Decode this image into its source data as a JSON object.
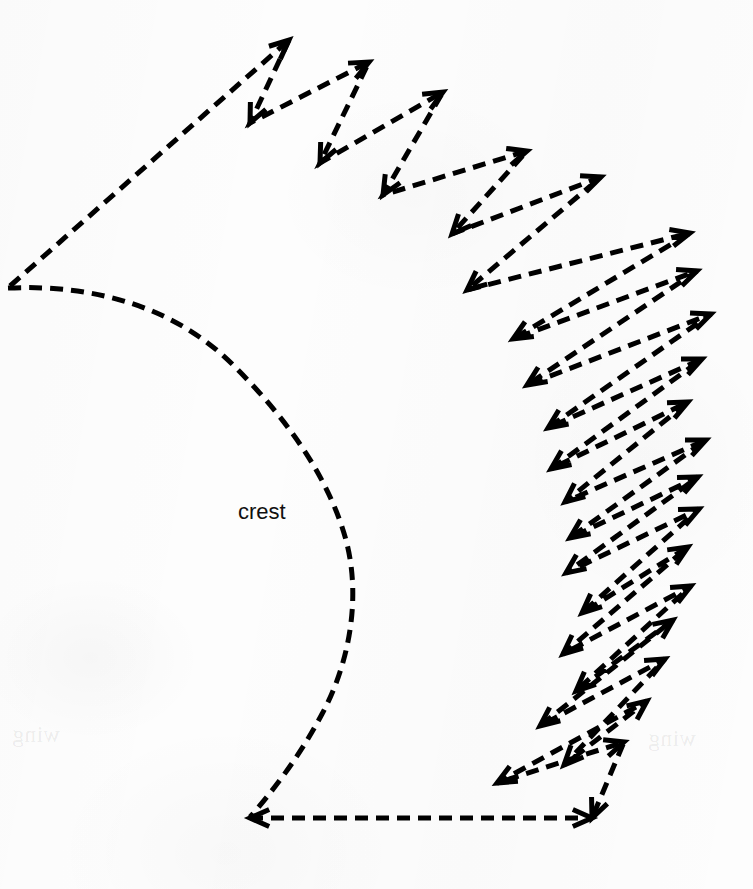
{
  "canvas": {
    "width": 753,
    "height": 889,
    "background_color": "#fdfdfd",
    "ink_color": "#000000"
  },
  "diagram": {
    "title_visible": false,
    "stroke": {
      "color": "#000000",
      "width_px": 5,
      "dash_length_px": 13,
      "gap_length_px": 8,
      "style": "dashed-with-arrowheads"
    },
    "labels": [
      {
        "id": "crest-label",
        "text": "crest",
        "x": 238,
        "y": 501,
        "font_size_px": 22,
        "color": "#101010"
      }
    ],
    "paths": {
      "crest_curve": {
        "name": "crest-curve",
        "description": "smooth dashed curve sweeping from the left edge across and down to the bottom-left corner of the base line",
        "d": "M 8 288 C 100 284 180 310 236 368 C 292 424 330 482 346 540 C 362 600 348 666 322 714 C 300 756 272 792 250 817",
        "arrowhead_start": false,
        "arrowhead_end": false
      },
      "base_line": {
        "name": "base-line",
        "description": "horizontal dashed base line along the bottom of the figure",
        "d": "M 250 818 L 592 818",
        "arrowhead_start": true,
        "arrowhead_end": true
      },
      "leading_edge": {
        "name": "leading-edge-line",
        "description": "long straight dashed line from the left vertex up to the first spike tip",
        "d": "M 10 286 L 289 40",
        "arrowhead_start": false,
        "arrowhead_end": true
      },
      "zigzag_spikes": {
        "name": "spike-zigzag-chain",
        "description": "chain of zigzag dashed segments forming spiky crest feathers; each turn carries an arrowhead",
        "points": [
          [
            289,
            40
          ],
          [
            250,
            123
          ],
          [
            369,
            62
          ],
          [
            320,
            163
          ],
          [
            443,
            92
          ],
          [
            383,
            195
          ],
          [
            527,
            151
          ],
          [
            452,
            234
          ],
          [
            601,
            177
          ],
          [
            467,
            290
          ],
          [
            690,
            233
          ],
          [
            513,
            339
          ],
          [
            697,
            271
          ],
          [
            527,
            385
          ],
          [
            711,
            314
          ],
          [
            548,
            428
          ],
          [
            702,
            359
          ],
          [
            551,
            469
          ],
          [
            688,
            402
          ],
          [
            565,
            502
          ],
          [
            706,
            440
          ],
          [
            570,
            538
          ],
          [
            698,
            477
          ],
          [
            566,
            573
          ],
          [
            699,
            509
          ],
          [
            582,
            613
          ],
          [
            688,
            547
          ],
          [
            563,
            654
          ],
          [
            691,
            586
          ],
          [
            576,
            691
          ],
          [
            673,
            620
          ],
          [
            540,
            726
          ],
          [
            665,
            659
          ],
          [
            564,
            765
          ],
          [
            647,
            701
          ],
          [
            497,
            783
          ],
          [
            624,
            742
          ],
          [
            592,
            818
          ]
        ],
        "arrowheads_at_every_vertex": true
      }
    },
    "bleed_through": [
      {
        "id": "bleed-wing-left",
        "text": "wing",
        "x": 12,
        "y": 736,
        "opacity": 0.085
      },
      {
        "id": "bleed-wing-right",
        "text": "wing",
        "x": 660,
        "y": 740,
        "opacity": 0.085
      }
    ]
  }
}
